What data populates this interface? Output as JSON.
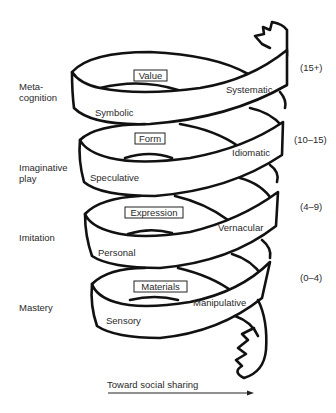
{
  "diagram": {
    "stages": [
      {
        "left_label_line1": "Meta-",
        "left_label_line2": "cognition",
        "box": "Value",
        "left_mode": "Symbolic",
        "right_mode": "Systematic",
        "age": "(15+)"
      },
      {
        "left_label_line1": "Imaginative",
        "left_label_line2": "play",
        "box": "Form",
        "left_mode": "Speculative",
        "right_mode": "Idiomatic",
        "age": "(10–15)"
      },
      {
        "left_label_line1": "Imitation",
        "left_label_line2": "",
        "box": "Expression",
        "left_mode": "Personal",
        "right_mode": "Vernacular",
        "age": "(4–9)"
      },
      {
        "left_label_line1": "Mastery",
        "left_label_line2": "",
        "box": "Materials",
        "left_mode": "Sensory",
        "right_mode": "Manipulative",
        "age": "(0–4)"
      }
    ],
    "arrow_label": "Toward social sharing",
    "colors": {
      "stroke": "#111111",
      "background": "#ffffff",
      "text": "#2a2a2a"
    }
  }
}
